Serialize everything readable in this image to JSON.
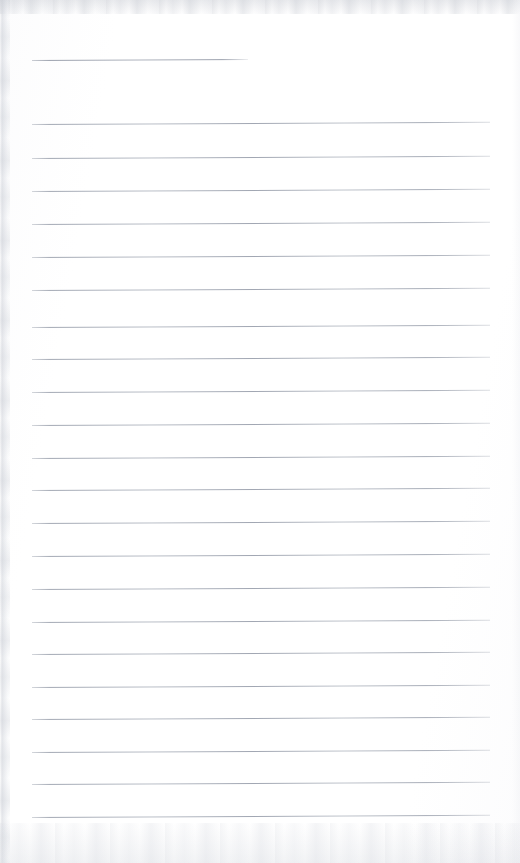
{
  "document": {
    "kind": "scanned-lined-notepad-page",
    "title": "Blank Lined Notepad Page",
    "content_text": "",
    "is_blank": true,
    "page_width": 520,
    "page_height": 863
  },
  "colors": {
    "page_background": "#fdfdfe",
    "rule_line": "#9ea4b0",
    "scan_artifact": "#c8cbd2"
  },
  "layout": {
    "left_margin": 32,
    "right_margin": 30,
    "line_spacing": 32.7,
    "line_thickness": 1,
    "skew_degrees": -0.28
  },
  "artifacts": [
    {
      "name": "top-scan-band",
      "edge": "top",
      "thickness": 14
    },
    {
      "name": "bottom-scan-band",
      "edge": "bottom",
      "thickness": 40
    },
    {
      "name": "left-scan-band",
      "edge": "left",
      "thickness": 10
    },
    {
      "name": "right-scan-band",
      "edge": "right",
      "thickness": 8
    }
  ],
  "rules": [
    {
      "index": 1,
      "y": 60,
      "x": 32,
      "width": 216,
      "short": true,
      "label": "heading-rule"
    },
    {
      "index": 2,
      "y": 124,
      "x": 32,
      "width": 458,
      "short": false,
      "label": "body-rule"
    },
    {
      "index": 3,
      "y": 158,
      "x": 32,
      "width": 458,
      "short": false,
      "label": "body-rule"
    },
    {
      "index": 4,
      "y": 191,
      "x": 32,
      "width": 458,
      "short": false,
      "label": "body-rule"
    },
    {
      "index": 5,
      "y": 224,
      "x": 32,
      "width": 458,
      "short": false,
      "label": "body-rule"
    },
    {
      "index": 6,
      "y": 257,
      "x": 32,
      "width": 458,
      "short": false,
      "label": "body-rule"
    },
    {
      "index": 7,
      "y": 290,
      "x": 32,
      "width": 458,
      "short": false,
      "label": "body-rule"
    },
    {
      "index": 8,
      "y": 327,
      "x": 32,
      "width": 458,
      "short": false,
      "label": "body-rule"
    },
    {
      "index": 9,
      "y": 359,
      "x": 32,
      "width": 458,
      "short": false,
      "label": "body-rule"
    },
    {
      "index": 10,
      "y": 392,
      "x": 32,
      "width": 458,
      "short": false,
      "label": "body-rule"
    },
    {
      "index": 11,
      "y": 425,
      "x": 32,
      "width": 458,
      "short": false,
      "label": "body-rule"
    },
    {
      "index": 12,
      "y": 458,
      "x": 32,
      "width": 458,
      "short": false,
      "label": "body-rule"
    },
    {
      "index": 13,
      "y": 490,
      "x": 32,
      "width": 458,
      "short": false,
      "label": "body-rule"
    },
    {
      "index": 14,
      "y": 523,
      "x": 32,
      "width": 458,
      "short": false,
      "label": "body-rule"
    },
    {
      "index": 15,
      "y": 556,
      "x": 32,
      "width": 458,
      "short": false,
      "label": "body-rule"
    },
    {
      "index": 16,
      "y": 589,
      "x": 32,
      "width": 458,
      "short": false,
      "label": "body-rule"
    },
    {
      "index": 17,
      "y": 622,
      "x": 32,
      "width": 458,
      "short": false,
      "label": "body-rule"
    },
    {
      "index": 18,
      "y": 654,
      "x": 32,
      "width": 458,
      "short": false,
      "label": "body-rule"
    },
    {
      "index": 19,
      "y": 687,
      "x": 32,
      "width": 458,
      "short": false,
      "label": "body-rule"
    },
    {
      "index": 20,
      "y": 719,
      "x": 32,
      "width": 458,
      "short": false,
      "label": "body-rule"
    },
    {
      "index": 21,
      "y": 752,
      "x": 32,
      "width": 458,
      "short": false,
      "label": "body-rule"
    },
    {
      "index": 22,
      "y": 784,
      "x": 32,
      "width": 458,
      "short": false,
      "label": "body-rule"
    },
    {
      "index": 23,
      "y": 817,
      "x": 32,
      "width": 458,
      "short": false,
      "label": "body-rule"
    }
  ]
}
